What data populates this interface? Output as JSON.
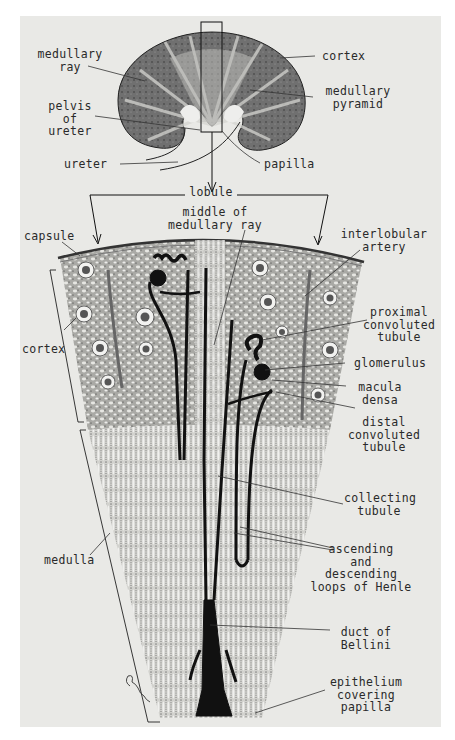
{
  "figure": {
    "colors": {
      "plate_bg": "#e9e9e6",
      "ink": "#1a1a1a",
      "tissue_dark": "#6c6c6a",
      "tissue_light": "#cfcfcb"
    }
  },
  "kidney_labels": {
    "medullary_ray": "medullary\nray",
    "pelvis_of_ureter": "pelvis\nof\nureter",
    "ureter": "ureter",
    "cortex": "cortex",
    "medullary_pyramid": "medullary\npyramid",
    "papilla": "papilla"
  },
  "lobule_labels": {
    "lobule": "lobule",
    "middle_of_medullary_ray": "middle of\nmedullary ray",
    "capsule": "capsule",
    "interlobular_artery": "interlobular\nartery",
    "cortex": "cortex",
    "proximal_convoluted_tubule": "proximal\nconvoluted\ntubule",
    "glomerulus": "glomerulus",
    "macula_densa": "macula\ndensa",
    "distal_convoluted_tubule": "distal\nconvoluted\ntubule",
    "collecting_tubule": "collecting\ntubule",
    "medulla": "medulla",
    "loops_of_henle": "ascending\nand\ndescending\nloops of Henle",
    "duct_of_bellini": "duct of\nBellini",
    "epithelium_covering_papilla": "epithelium\ncovering\npapilla"
  },
  "signature": "artist signature"
}
